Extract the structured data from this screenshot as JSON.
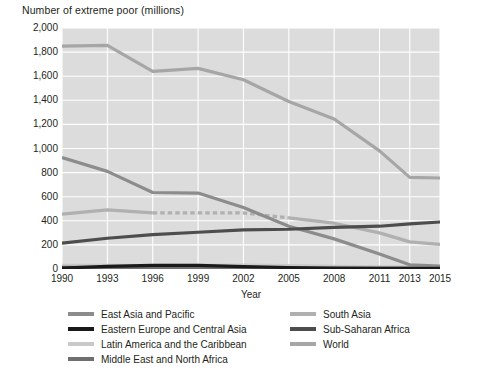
{
  "chart_data": {
    "type": "line",
    "title": "Number of extreme poor (millions)",
    "xlabel": "Year",
    "ylabel": "",
    "x": [
      1990,
      1993,
      1996,
      1999,
      2002,
      2005,
      2008,
      2011,
      2013,
      2015
    ],
    "xtick_labels": [
      "1990",
      "1993",
      "1996",
      "1999",
      "2002",
      "2005",
      "2008",
      "2011",
      "2013",
      "2015"
    ],
    "ytick_labels": [
      "0",
      "200",
      "400",
      "600",
      "800",
      "1,000",
      "1,200",
      "1,400",
      "1,600",
      "1,800",
      "2,000"
    ],
    "ytick_values": [
      0,
      200,
      400,
      600,
      800,
      1000,
      1200,
      1400,
      1600,
      1800,
      2000
    ],
    "ylim": [
      0,
      2000
    ],
    "xlim": [
      1990,
      2015
    ],
    "grid": true,
    "grid_color": "#ffffff",
    "plot_background": "#dcdcdc",
    "legend_position": "below",
    "series": [
      {
        "name": "World",
        "color": "#a6a6a6",
        "values": [
          1850,
          1855,
          1640,
          1665,
          1570,
          1390,
          1245,
          980,
          760,
          755
        ]
      },
      {
        "name": "East Asia and Pacific",
        "color": "#8c8c8c",
        "values": [
          925,
          810,
          635,
          630,
          510,
          355,
          250,
          125,
          35,
          25
        ]
      },
      {
        "name": "South Asia",
        "color": "#b0b0b0",
        "values": [
          455,
          490,
          465,
          465,
          465,
          425,
          380,
          300,
          225,
          205
        ],
        "dashed_segment": {
          "from_index": 2,
          "to_index": 5
        }
      },
      {
        "name": "Sub-Saharan Africa",
        "color": "#4d4d4d",
        "values": [
          215,
          255,
          285,
          305,
          325,
          330,
          345,
          355,
          375,
          390
        ]
      },
      {
        "name": "Latin America and the Caribbean",
        "color": "#c9c9c9",
        "values": [
          30,
          30,
          28,
          30,
          32,
          28,
          22,
          18,
          17,
          16
        ]
      },
      {
        "name": "Middle East and North Africa",
        "color": "#6f6f6f",
        "values": [
          14,
          12,
          11,
          11,
          11,
          10,
          9,
          9,
          9,
          9
        ]
      },
      {
        "name": "Eastern Europe and Central Asia",
        "color": "#1a1a1a",
        "values": [
          8,
          22,
          30,
          30,
          20,
          12,
          6,
          4,
          4,
          4
        ]
      }
    ]
  },
  "legend": {
    "columns": [
      {
        "items": [
          {
            "label": "East Asia and Pacific",
            "color": "#8c8c8c"
          },
          {
            "label": "Eastern Europe and Central Asia",
            "color": "#1a1a1a"
          },
          {
            "label": "Latin America and the Caribbean",
            "color": "#c9c9c9"
          },
          {
            "label": "Middle East and North Africa",
            "color": "#6f6f6f"
          }
        ]
      },
      {
        "items": [
          {
            "label": "South Asia",
            "color": "#b0b0b0"
          },
          {
            "label": "Sub-Saharan Africa",
            "color": "#4d4d4d"
          },
          {
            "label": "World",
            "color": "#a6a6a6"
          }
        ]
      }
    ]
  }
}
